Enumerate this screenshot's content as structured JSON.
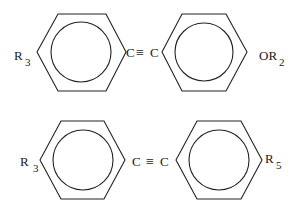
{
  "diagram": {
    "type": "chemical-structures",
    "molecules": [
      {
        "id": "top",
        "rings": [
          {
            "cx": 81,
            "cy": 52,
            "label_left": "R",
            "label_left_sub": "3"
          },
          {
            "cx": 204,
            "cy": 52,
            "label_right": "OR",
            "label_right_sub": "2"
          }
        ],
        "linker": {
          "left_atom": "C",
          "bond": "≡",
          "right_atom": "C"
        }
      },
      {
        "id": "bottom",
        "rings": [
          {
            "cx": 83,
            "cy": 160,
            "label_left": "R",
            "label_left_sub": "3"
          },
          {
            "cx": 219,
            "cy": 160,
            "label_right": "R",
            "label_right_sub": "5"
          }
        ],
        "linker": {
          "left_atom": "C",
          "bond": "≡",
          "right_atom": "C"
        }
      }
    ],
    "text": {
      "top_r3": "R",
      "top_r3_sub": "3",
      "top_c1": "C",
      "top_bond": "≡",
      "top_c2": "C",
      "top_or2": "OR",
      "top_or2_sub": "2",
      "bot_r3": "R",
      "bot_r3_sub": "3",
      "bot_c1": "C",
      "bot_bond": "≡",
      "bot_c2": "C",
      "bot_r5": "R",
      "bot_r5_sub": "5"
    }
  }
}
